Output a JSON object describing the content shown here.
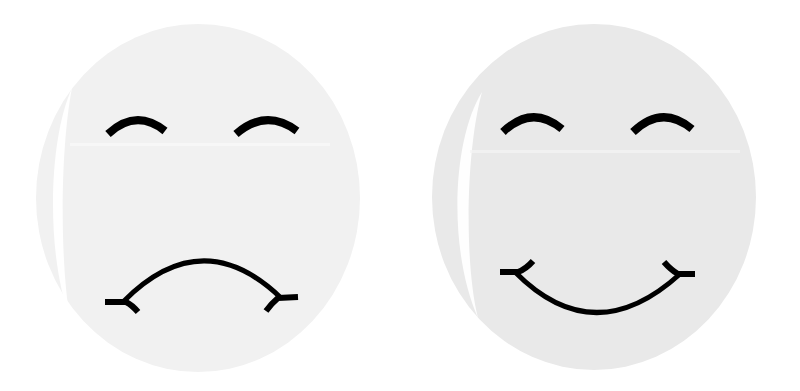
{
  "faces": [
    {
      "mood": "sad",
      "label": "Sad face",
      "fill": "#f1f1f1",
      "highlight": "#ffffff",
      "ink": "#000000",
      "cx": 198,
      "cy": 198,
      "rx": 162,
      "ry": 174
    },
    {
      "mood": "happy",
      "label": "Happy face",
      "fill": "#e9e9e9",
      "highlight": "#ffffff",
      "ink": "#000000",
      "cx": 594,
      "cy": 197,
      "rx": 162,
      "ry": 173
    }
  ]
}
